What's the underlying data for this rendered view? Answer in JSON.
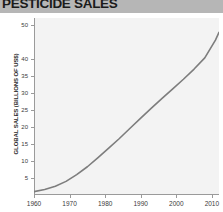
{
  "chart_title": "PESTICIDE SALES",
  "axes": {
    "ylabel": "GLOBAL SALES (BILLIONS OF US$)",
    "xlabel": "",
    "yticks": [
      5,
      10,
      15,
      20,
      25,
      30,
      35,
      40,
      50
    ],
    "ytick_labels": [
      "5",
      "10",
      "15",
      "20",
      "25",
      "30",
      "35",
      "40",
      "50"
    ],
    "xticks": [
      1960,
      1970,
      1980,
      1990,
      2000,
      2010
    ],
    "xtick_labels": [
      "1960",
      "1970",
      "1980",
      "1990",
      "2000",
      "2010"
    ]
  },
  "colors": {
    "title_banner": "#b6b6b6",
    "title_text": "#1b1b1b",
    "plot_background": "#f3f3f3",
    "axis": "#9a9a9a",
    "line": "#7d7d7d",
    "tick_text": "#3a3a3a"
  },
  "chart_data": {
    "type": "line",
    "title": "PESTICIDE SALES",
    "xlabel": "",
    "ylabel": "GLOBAL SALES (BILLIONS OF US$)",
    "xlim": [
      1960,
      2012
    ],
    "ylim": [
      0,
      52
    ],
    "grid": false,
    "legend": "none",
    "x": [
      1960,
      1963,
      1966,
      1969,
      1972,
      1975,
      1978,
      1981,
      1984,
      1987,
      1990,
      1993,
      1996,
      1999,
      2002,
      2005,
      2008,
      2011,
      2012
    ],
    "series": [
      {
        "name": "Global pesticide sales",
        "values": [
          1.0,
          1.6,
          2.6,
          4.0,
          6.0,
          8.3,
          11.0,
          13.8,
          16.6,
          19.6,
          22.6,
          25.5,
          28.4,
          31.2,
          34.0,
          37.0,
          40.3,
          45.5,
          47.8
        ]
      }
    ]
  }
}
